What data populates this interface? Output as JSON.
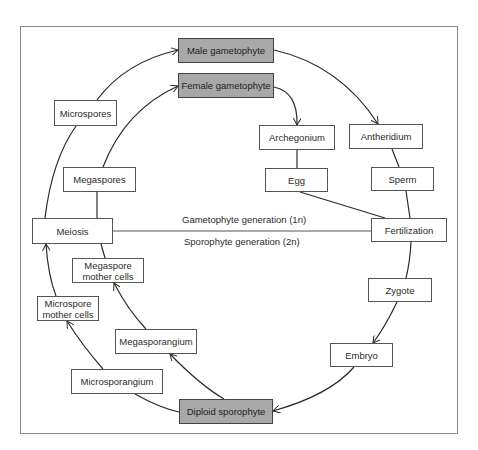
{
  "diagram": {
    "type": "life-cycle",
    "generation_labels": {
      "gametophyte": "Gametophyte generation (1n)",
      "sporophyte": "Sporophyte generation (2n)"
    },
    "nodes": {
      "male_gametophyte": "Male gametophyte",
      "female_gametophyte": "Female gametophyte",
      "microspores": "Microspores",
      "megaspores": "Megaspores",
      "archegonium": "Archegonium",
      "antheridium": "Antheridium",
      "egg": "Egg",
      "sperm": "Sperm",
      "meiosis": "Meiosis",
      "fertilization": "Fertilization",
      "megaspore_mother_cells_line1": "Megaspore",
      "megaspore_mother_cells_line2": "mother cells",
      "zygote": "Zygote",
      "microspore_mother_cells_line1": "Microspore",
      "microspore_mother_cells_line2": "mother cells",
      "megasporangium": "Megasporangium",
      "embryo": "Embryo",
      "microsporangium": "Microsporangium",
      "diploid_sporophyte": "Diploid sporophyte"
    },
    "edges": [
      {
        "from": "Diploid sporophyte",
        "to": "Microsporangium"
      },
      {
        "from": "Microsporangium",
        "to": "Microspore mother cells",
        "arrow": true
      },
      {
        "from": "Microspore mother cells",
        "to": "Meiosis",
        "arrow": true
      },
      {
        "from": "Meiosis",
        "to": "Microspores"
      },
      {
        "from": "Microspores",
        "to": "Male gametophyte",
        "arrow": true
      },
      {
        "from": "Male gametophyte",
        "to": "Antheridium",
        "arrow": true
      },
      {
        "from": "Antheridium",
        "to": "Sperm"
      },
      {
        "from": "Sperm",
        "to": "Fertilization"
      },
      {
        "from": "Diploid sporophyte",
        "to": "Megasporangium",
        "arrow": true
      },
      {
        "from": "Megasporangium",
        "to": "Megaspore mother cells",
        "arrow": true
      },
      {
        "from": "Megaspore mother cells",
        "to": "Meiosis"
      },
      {
        "from": "Meiosis",
        "to": "Megaspores"
      },
      {
        "from": "Megaspores",
        "to": "Female gametophyte",
        "arrow": true
      },
      {
        "from": "Female gametophyte",
        "to": "Archegonium",
        "arrow": true
      },
      {
        "from": "Archegonium",
        "to": "Egg"
      },
      {
        "from": "Egg",
        "to": "Fertilization"
      },
      {
        "from": "Fertilization",
        "to": "Zygote"
      },
      {
        "from": "Zygote",
        "to": "Embryo",
        "arrow": true
      },
      {
        "from": "Embryo",
        "to": "Diploid sporophyte",
        "arrow": true
      },
      {
        "from": "Meiosis",
        "to": "Fertilization",
        "note": "generation divider"
      }
    ],
    "colors": {
      "shaded_box": "#a8a8a8",
      "line": "#2a2a2a",
      "frame": "#8a8a8a"
    }
  }
}
